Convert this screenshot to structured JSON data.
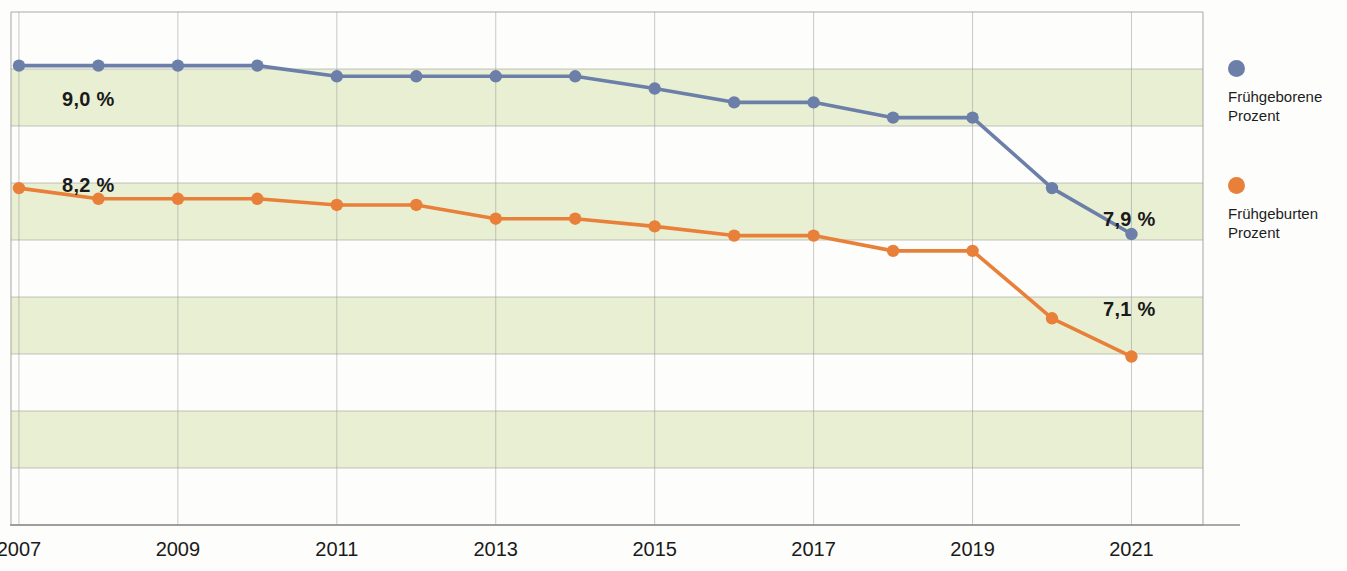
{
  "chart_data": {
    "type": "line",
    "title": "",
    "subtitle": "",
    "xlabel": "",
    "ylabel": "",
    "grid": true,
    "legend_position": "right",
    "x": [
      2007,
      2008,
      2009,
      2010,
      2011,
      2012,
      2013,
      2014,
      2015,
      2016,
      2017,
      2018,
      2019,
      2020,
      2021
    ],
    "xtick_labels": [
      "2007",
      "2009",
      "2011",
      "2013",
      "2015",
      "2017",
      "2019",
      "2021"
    ],
    "xticks": [
      2007,
      2009,
      2011,
      2013,
      2015,
      2017,
      2019,
      2021
    ],
    "xlim": [
      2006.9,
      2021.9
    ],
    "ylim": [
      6.0,
      9.35
    ],
    "ytick_labels": [],
    "series": [
      {
        "name": "Frühgeborene Prozent",
        "color": "#6b7fa8",
        "values": [
          9.0,
          9.0,
          9.0,
          9.0,
          8.93,
          8.93,
          8.93,
          8.93,
          8.85,
          8.76,
          8.76,
          8.66,
          8.66,
          8.2,
          7.9
        ]
      },
      {
        "name": "Frühgeburten Prozent",
        "color": "#e8803a",
        "values": [
          8.2,
          8.13,
          8.13,
          8.13,
          8.09,
          8.09,
          8.0,
          8.0,
          7.95,
          7.89,
          7.89,
          7.79,
          7.79,
          7.35,
          7.1
        ]
      }
    ],
    "annotations": [
      {
        "text": "9,0 %",
        "series": "Frühgeborene Prozent",
        "x": 2007,
        "value": 9.0,
        "px": 62,
        "py": 88
      },
      {
        "text": "8,2 %",
        "series": "Frühgeburten Prozent",
        "x": 2007,
        "value": 8.2,
        "px": 62,
        "py": 174
      },
      {
        "text": "7,9 %",
        "series": "Frühgeborene Prozent",
        "x": 2021,
        "value": 7.9,
        "px": 1103,
        "py": 208
      },
      {
        "text": "7,1 %",
        "series": "Frühgeburten Prozent",
        "x": 2021,
        "value": 7.1,
        "px": 1103,
        "py": 298
      }
    ],
    "band_color": "#e9efd2",
    "gridline_color": "#9a9a9a",
    "background": "#fdfdfb"
  },
  "legend": {
    "entries": [
      {
        "label": "Frühgeborene\nProzent",
        "color": "#6b7fa8",
        "top": 0
      },
      {
        "label": "Frühgeburten\nProzent",
        "color": "#e8803a",
        "top": 117
      }
    ]
  },
  "axis": {
    "x_tick_labels": [
      "2007",
      "2009",
      "2011",
      "2013",
      "2015",
      "2017",
      "2019",
      "2021"
    ]
  }
}
